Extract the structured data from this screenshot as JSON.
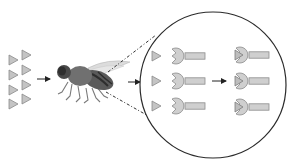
{
  "diagram": {
    "colors": {
      "background": "#ffffff",
      "ligand_fill": "#c4c4c4",
      "ligand_stroke": "#8a8a8a",
      "receptor_fill": "#cfcfcf",
      "receptor_stroke": "#8c8c8c",
      "line": "#222222",
      "fly_body": "#6e6e6e",
      "fly_dark": "#3c3c3c",
      "fly_wing": "#d8d8d8"
    },
    "stages": [
      {
        "id": "odorant-molecules",
        "count": 8,
        "layout": "2 columns x 4 rows of triangles"
      },
      {
        "id": "fly",
        "label": "fly"
      },
      {
        "id": "magnified-circle",
        "unbound_pairs": 3,
        "bound_receptors": 3
      }
    ],
    "arrows": [
      {
        "from": "odorant-molecules",
        "to": "fly"
      },
      {
        "from": "fly",
        "to": "magnified-circle"
      },
      {
        "from": "unbound-receptors",
        "to": "bound-receptors"
      }
    ]
  }
}
